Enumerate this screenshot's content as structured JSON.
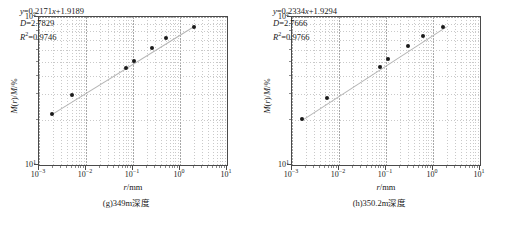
{
  "chart_data": [
    {
      "type": "scatter",
      "panel_id": "g",
      "caption": "(g)349m深度",
      "xlabel": "r/mm",
      "ylabel": "M(r)/M/%",
      "xscale": "log",
      "yscale": "log",
      "xlim": [
        0.001,
        10
      ],
      "ylim": [
        10,
        100
      ],
      "xticks": [
        "10⁻³",
        "10⁻²",
        "10⁻¹",
        "10⁰",
        "10¹"
      ],
      "xtick_exponents": [
        "-3",
        "-2",
        "-1",
        "0",
        "1"
      ],
      "ytick_exponents": [
        "1",
        "2"
      ],
      "yticks": [
        "10¹",
        "10²"
      ],
      "grid": true,
      "legend": "none",
      "annotation": {
        "equation": "y=0.2171x+1.9189",
        "slope": 0.2171,
        "intercept": 1.9189,
        "D_label": "D=2.7829",
        "D": 2.7829,
        "R2_label": "R²=0.9746",
        "R2": 0.9746
      },
      "points": [
        {
          "x": 0.0019,
          "y": 22.0
        },
        {
          "x": 0.005,
          "y": 29.5
        },
        {
          "x": 0.07,
          "y": 45.5
        },
        {
          "x": 0.105,
          "y": 50.5
        },
        {
          "x": 0.25,
          "y": 62.0
        },
        {
          "x": 0.5,
          "y": 72.0
        },
        {
          "x": 2.0,
          "y": 86.0
        }
      ],
      "fit_endpoints": {
        "x1": 0.0019,
        "y1": 22.0,
        "x2": 2.0,
        "y2": 86.5
      }
    },
    {
      "type": "scatter",
      "panel_id": "h",
      "caption": "(h)350.2m深度",
      "xlabel": "r/mm",
      "ylabel": "M(r)/M/%",
      "xscale": "log",
      "yscale": "log",
      "xlim": [
        0.001,
        10
      ],
      "ylim": [
        10,
        100
      ],
      "xticks": [
        "10⁻³",
        "10⁻²",
        "10⁻¹",
        "10⁰",
        "10¹"
      ],
      "xtick_exponents": [
        "-3",
        "-2",
        "-1",
        "0",
        "1"
      ],
      "ytick_exponents": [
        "1",
        "2"
      ],
      "yticks": [
        "10¹",
        "10²"
      ],
      "grid": true,
      "legend": "none",
      "annotation": {
        "equation": "y=0.2334x+1.9294",
        "slope": 0.2334,
        "intercept": 1.9294,
        "D_label": "D=2.7666",
        "D": 2.7666,
        "R2_label": "R²=0.9766",
        "R2": 0.9766
      },
      "points": [
        {
          "x": 0.0016,
          "y": 20.5
        },
        {
          "x": 0.0055,
          "y": 28.5
        },
        {
          "x": 0.075,
          "y": 46.0
        },
        {
          "x": 0.11,
          "y": 52.0
        },
        {
          "x": 0.3,
          "y": 64.0
        },
        {
          "x": 0.6,
          "y": 74.5
        },
        {
          "x": 1.6,
          "y": 85.0
        }
      ],
      "fit_endpoints": {
        "x1": 0.0016,
        "y1": 20.0,
        "x2": 1.9,
        "y2": 86.0
      }
    }
  ],
  "colors": {
    "point": "#1a1a1a",
    "fit_line": "#b5b5b5",
    "frame": "#4a4a4a",
    "grid": "#c9c9c9",
    "background": "#ffffff"
  }
}
